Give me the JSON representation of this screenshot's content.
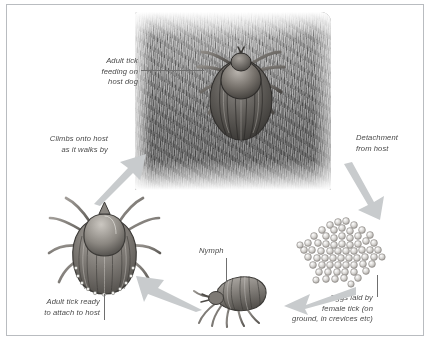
{
  "diagram": {
    "labels": {
      "adult_feeding": "Adult tick\nfeeding on\nhost dog",
      "climbs": "Climbs onto host\nas it walks by",
      "detachment": "Detachment\nfrom host",
      "adult_ready": "Adult tick ready\nto attach to host",
      "nymph": "Nymph",
      "eggs": "Eggs laid by\nfemale tick (on\nground, in crevices etc)"
    },
    "figures": {
      "fur_patch": "dog-fur-patch",
      "engorged_tick": "engorged-adult-tick-on-fur",
      "unfed_tick": "unfed-adult-tick",
      "nymph_tick": "nymph-tick",
      "egg_mass": "tick-egg-mass"
    },
    "arrows": [
      {
        "name": "arrow-climbs-onto-host",
        "direction": "up-right"
      },
      {
        "name": "arrow-detachment-from-host",
        "direction": "down-right"
      },
      {
        "name": "arrow-eggs-to-nymph",
        "direction": "left"
      },
      {
        "name": "arrow-nymph-to-adult",
        "direction": "up-left"
      }
    ],
    "colors": {
      "frame": "#b9bcc0",
      "text": "#4a4a4a",
      "arrow": "#c6c9cb",
      "leader": "#6f6f6f",
      "background": "#ffffff"
    }
  }
}
